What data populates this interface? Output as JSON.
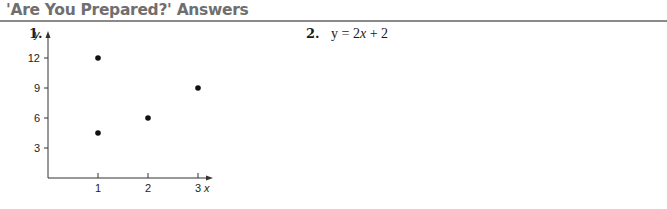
{
  "header": {
    "title": "'Are You Prepared?' Answers"
  },
  "problems": [
    {
      "number": "1."
    },
    {
      "number": "2.",
      "answer_prefix": "y = 2",
      "answer_var": "x",
      "answer_suffix": " + 2"
    }
  ],
  "colors": {
    "header_text": "#6f6f6f",
    "rule": "#8a8a8a",
    "ink": "#1a1a1a"
  },
  "chart_data": {
    "type": "scatter",
    "title": "",
    "xlabel": "x",
    "ylabel": "y",
    "x_ticks": [
      "1",
      "2",
      "3"
    ],
    "y_ticks": [
      "3",
      "6",
      "9",
      "12"
    ],
    "xlim": [
      0,
      3.6
    ],
    "ylim": [
      0,
      14
    ],
    "grid": false,
    "legend": null,
    "points": [
      {
        "x": 1,
        "y": 12
      },
      {
        "x": 1,
        "y": 4.5
      },
      {
        "x": 2,
        "y": 6
      },
      {
        "x": 3,
        "y": 9
      }
    ]
  }
}
